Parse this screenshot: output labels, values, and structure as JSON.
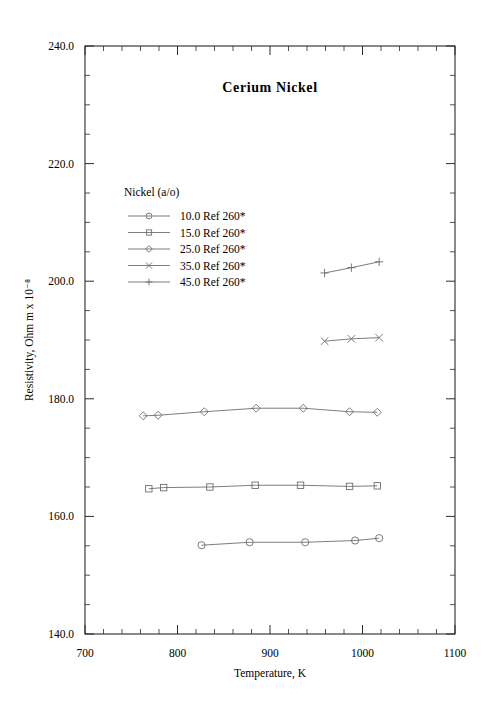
{
  "figure": {
    "title": "Cerium  Nickel",
    "legend_heading": "Nickel (a/o)",
    "background_color": "#ffffff",
    "line_color": "#6e6e6e",
    "axis_color": "#2b2b2b"
  },
  "chart_data": {
    "type": "line",
    "title": "Cerium  Nickel",
    "xlabel": "Temperature,  K",
    "ylabel": "Resistivity, Ohm m x 10⁻⁸",
    "xlim": [
      700,
      1100
    ],
    "ylim": [
      140.0,
      240.0
    ],
    "xticks": [
      700,
      800,
      900,
      1000,
      1100
    ],
    "xtick_labels": [
      "700",
      "800",
      "900",
      "1000",
      "1100"
    ],
    "yticks": [
      140.0,
      160.0,
      180.0,
      200.0,
      220.0,
      240.0
    ],
    "ytick_labels": [
      "140.0",
      "160.0",
      "180.0",
      "200.0",
      "220.0",
      "240.0"
    ],
    "x_minor_step": 20,
    "y_minor_step": 5,
    "grid": false,
    "legend_position": "upper-left-inside",
    "series": [
      {
        "name": "10.0 Ref 260*",
        "composition": 10.0,
        "reference": "Ref 260*",
        "marker": "circle",
        "x": [
          826,
          878,
          938,
          992,
          1018
        ],
        "y": [
          155.1,
          155.6,
          155.6,
          155.9,
          156.3
        ]
      },
      {
        "name": "15.0 Ref 260*",
        "composition": 15.0,
        "reference": "Ref 260*",
        "marker": "square",
        "x": [
          769,
          785,
          835,
          884,
          933,
          986,
          1016
        ],
        "y": [
          164.7,
          164.9,
          165.0,
          165.3,
          165.3,
          165.1,
          165.2
        ]
      },
      {
        "name": "25.0 Ref 260*",
        "composition": 25.0,
        "reference": "Ref 260*",
        "marker": "diamond",
        "x": [
          763,
          779,
          829,
          885,
          936,
          986,
          1016
        ],
        "y": [
          177.1,
          177.2,
          177.8,
          178.4,
          178.4,
          177.8,
          177.7
        ]
      },
      {
        "name": "35.0 Ref 260*",
        "composition": 35.0,
        "reference": "Ref 260*",
        "marker": "cross",
        "x": [
          959,
          988,
          1018
        ],
        "y": [
          189.8,
          190.2,
          190.4
        ]
      },
      {
        "name": "45.0 Ref 260*",
        "composition": 45.0,
        "reference": "Ref 260*",
        "marker": "plus",
        "x": [
          959,
          988,
          1018
        ],
        "y": [
          201.4,
          202.3,
          203.3
        ]
      }
    ],
    "legend_entries": [
      {
        "label": "10.0 Ref 260*",
        "marker": "circle"
      },
      {
        "label": "15.0 Ref 260*",
        "marker": "square"
      },
      {
        "label": "25.0 Ref 260*",
        "marker": "diamond"
      },
      {
        "label": "35.0 Ref 260*",
        "marker": "cross"
      },
      {
        "label": "45.0 Ref 260*",
        "marker": "plus"
      }
    ]
  }
}
